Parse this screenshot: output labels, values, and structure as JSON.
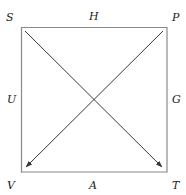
{
  "diagram": {
    "type": "square-with-crossing-arrows",
    "colors": {
      "square_edge": "#8a8a8a",
      "arrow": "#3a3a3a",
      "label": "#222222",
      "background": "#ffffff"
    },
    "corners": {
      "top_left": "S",
      "top_right": "P",
      "bottom_left": "V",
      "bottom_right": "T"
    },
    "edge_labels": {
      "top": "H",
      "left": "U",
      "right": "G",
      "bottom": "A"
    },
    "arrows": [
      {
        "from": "S",
        "to": "T"
      },
      {
        "from": "P",
        "to": "V"
      }
    ]
  }
}
